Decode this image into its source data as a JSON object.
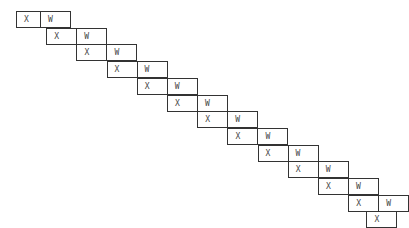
{
  "diagram": {
    "rows": [
      {
        "x": "X",
        "w": "W"
      },
      {
        "x": "X",
        "w": "W"
      },
      {
        "x": "X",
        "w": "W"
      },
      {
        "x": "X",
        "w": "W"
      },
      {
        "x": "X",
        "w": "W"
      },
      {
        "x": "X",
        "w": "W"
      },
      {
        "x": "X",
        "w": "W"
      },
      {
        "x": "X",
        "w": "W"
      },
      {
        "x": "X",
        "w": "W"
      },
      {
        "x": "X",
        "w": "W"
      },
      {
        "x": "X",
        "w": "W"
      },
      {
        "x": "X",
        "w": "W"
      },
      {
        "x": "X",
        "w": null
      }
    ]
  }
}
